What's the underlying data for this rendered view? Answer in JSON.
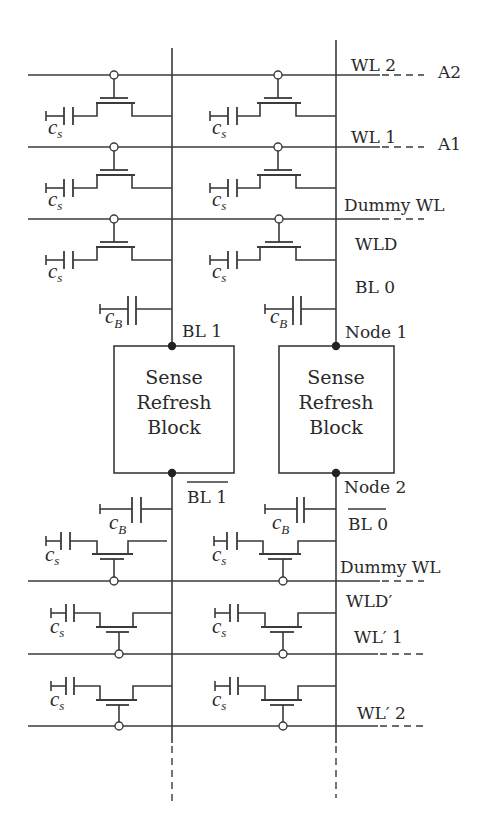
{
  "diagram": {
    "colors": {
      "stroke": "#3a3a3a",
      "background": "#ffffff",
      "node": "#222222"
    },
    "word_lines": {
      "wl2": "WL 2",
      "a2": "A2",
      "wl1": "WL 1",
      "a1": "A1",
      "dummy_top": "Dummy WL",
      "wld": "WLD",
      "dummy_bottom": "Dummy WL",
      "wld_prime": "WLD′",
      "wl_prime_1": "WL′ 1",
      "wl_prime_2": "WL′ 2"
    },
    "bit_lines": {
      "bl0": "BL 0",
      "bl1": "BL 1",
      "bl1_bar": "BL 1",
      "bl0_bar": "BL 0"
    },
    "nodes": {
      "node1": "Node 1",
      "node2": "Node 2"
    },
    "blocks": [
      {
        "line1": "Sense",
        "line2": "Refresh",
        "line3": "Block"
      },
      {
        "line1": "Sense",
        "line2": "Refresh",
        "line3": "Block"
      }
    ],
    "capacitors": {
      "storage_main": "c",
      "storage_sub": "s",
      "bitline_main": "c",
      "bitline_sub": "B"
    }
  }
}
